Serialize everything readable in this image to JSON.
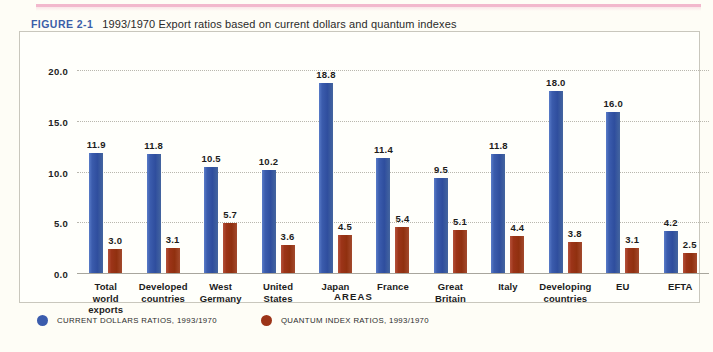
{
  "figure": {
    "label": "FIGURE 2-1",
    "title": "1993/1970 Export ratios based on current dollars and quantum indexes"
  },
  "colors": {
    "current_dollars": "#3b5cad",
    "quantum_index": "#9c3418",
    "figure_label": "#3b5fa8",
    "grid": "#b9b7ae",
    "frame": "#c9c7bd",
    "page_background": "#fefdf6",
    "rule": "#f2b8cd"
  },
  "chart_data": {
    "type": "bar",
    "title": "1993/1970 Export ratios based on current dollars and quantum indexes",
    "xlabel": "AREAS",
    "ylabel": "",
    "ylim": [
      0.0,
      20.0
    ],
    "yticks": [
      "0.0",
      "5.0",
      "10.0",
      "15.0",
      "20.0"
    ],
    "ytick_values": [
      0.0,
      5.0,
      10.0,
      15.0,
      20.0
    ],
    "grid": true,
    "legend_position": "bottom-left",
    "categories": [
      "Total world exports",
      "Developed countries",
      "West Germany",
      "United States",
      "Japan",
      "France",
      "Great Britain",
      "Italy",
      "Developing countries",
      "EU",
      "EFTA"
    ],
    "category_lines": [
      [
        "Total",
        "world",
        "exports"
      ],
      [
        "Developed",
        "countries"
      ],
      [
        "West",
        "Germany"
      ],
      [
        "United",
        "States"
      ],
      [
        "Japan"
      ],
      [
        "France"
      ],
      [
        "Great",
        "Britain"
      ],
      [
        "Italy"
      ],
      [
        "Developing",
        "countries"
      ],
      [
        "EU"
      ],
      [
        "EFTA"
      ]
    ],
    "series": [
      {
        "name": "CURRENT DOLLARS RATIOS, 1993/1970",
        "color": "#3b5cad",
        "values": [
          11.9,
          11.8,
          10.5,
          10.2,
          18.8,
          11.4,
          9.5,
          11.8,
          18.0,
          16.0,
          4.2
        ],
        "labels": [
          "11.9",
          "11.8",
          "10.5",
          "10.2",
          "18.8",
          "11.4",
          "9.5",
          "11.8",
          "18.0",
          "16.0",
          "4.2"
        ]
      },
      {
        "name": "QUANTUM INDEX RATIOS, 1993/1970",
        "color": "#9c3418",
        "values": [
          3.0,
          3.1,
          5.7,
          3.6,
          4.5,
          5.4,
          5.1,
          4.4,
          3.8,
          3.1,
          2.5
        ],
        "labels": [
          "3.0",
          "3.1",
          "5.7",
          "3.6",
          "4.5",
          "5.4",
          "5.1",
          "4.4",
          "3.8",
          "3.1",
          "2.5"
        ],
        "drawn_values": [
          2.5,
          2.6,
          5.0,
          2.9,
          3.8,
          4.6,
          4.3,
          3.7,
          3.2,
          2.6,
          2.1
        ]
      }
    ]
  },
  "legend": [
    {
      "label": "CURRENT DOLLARS RATIOS, 1993/1970",
      "color": "#3b5cad"
    },
    {
      "label": "QUANTUM INDEX RATIOS, 1993/1970",
      "color": "#9c3418"
    }
  ]
}
